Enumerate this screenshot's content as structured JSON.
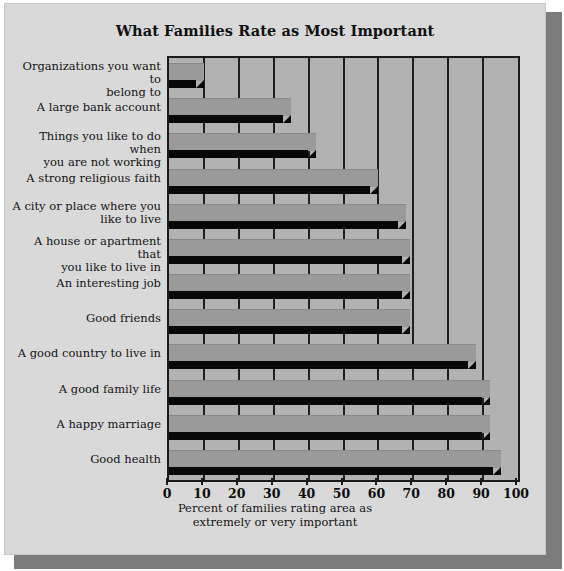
{
  "chart_data": {
    "type": "bar",
    "orientation": "horizontal",
    "title": "What Families Rate as Most Important",
    "xlabel": "Percent of families rating area as extremely or very important",
    "xlabel_line1": "Percent of families rating area as",
    "xlabel_line2": "extremely or very important",
    "ylabel": "",
    "xlim": [
      0,
      100
    ],
    "xticks": [
      0,
      10,
      20,
      30,
      40,
      50,
      60,
      70,
      80,
      90,
      100
    ],
    "xtick_labels": [
      "0",
      "10",
      "20",
      "30",
      "40",
      "50",
      "60",
      "70",
      "80",
      "90",
      "100"
    ],
    "grid": true,
    "legend": null,
    "categories": [
      "Organizations you want to belong to",
      "A large bank account",
      "Things you like to do when you are not working",
      "A strong religious faith",
      "A city or place where you like to live",
      "A house or apartment that you like to live in",
      "An interesting job",
      "Good friends",
      "A good country to live in",
      "A good family life",
      "A happy marriage",
      "Good health"
    ],
    "category_lines": [
      [
        "Organizations you want to",
        "belong to"
      ],
      [
        "A large bank account"
      ],
      [
        "Things you like to do when",
        "you are not working"
      ],
      [
        "A strong religious faith"
      ],
      [
        "A city or place where you",
        "like to live"
      ],
      [
        "A house or apartment that",
        "you like to live in"
      ],
      [
        "An interesting job"
      ],
      [
        "Good friends"
      ],
      [
        "A good country to live in"
      ],
      [
        "A good family life"
      ],
      [
        "A happy marriage"
      ],
      [
        "Good health"
      ]
    ],
    "values": [
      10,
      35,
      42,
      60,
      68,
      69,
      69,
      69,
      88,
      92,
      92,
      95
    ],
    "colors": {
      "bar_face": "#9a9a9a",
      "bar_shadow": "#080808",
      "plot_background": "#b2b2b2",
      "card_background": "#d9d9d9",
      "axis": "#1a1a1a",
      "drop_shadow": "#7c7c7c",
      "text": "#151515"
    }
  }
}
